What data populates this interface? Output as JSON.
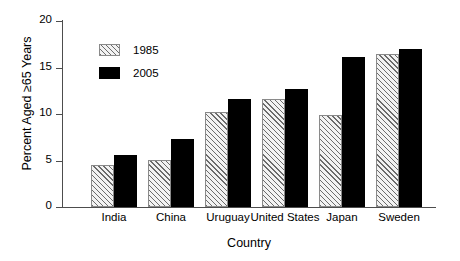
{
  "chart_data": {
    "type": "bar",
    "title": "",
    "xlabel": "Country",
    "ylabel": "Percent Aged ≥65 Years",
    "categories": [
      "India",
      "China",
      "Uruguay",
      "United States",
      "Japan",
      "Sweden"
    ],
    "series": [
      {
        "name": "1985",
        "values": [
          4.5,
          5.1,
          10.2,
          11.6,
          9.9,
          16.5
        ],
        "fill": "diagonal-hatch",
        "color": "#f2f2f2"
      },
      {
        "name": "2005",
        "values": [
          5.6,
          7.3,
          11.6,
          12.7,
          16.1,
          17.0
        ],
        "fill": "solid",
        "color": "#000000"
      }
    ],
    "ylim": [
      0,
      20
    ],
    "yticks": [
      0,
      5,
      10,
      15,
      20
    ],
    "yticklabels": [
      "0",
      "5",
      "10",
      "15",
      "20"
    ],
    "grid": false,
    "legend_position": "upper-left-inside"
  },
  "legend": {
    "entries": [
      {
        "label": "1985"
      },
      {
        "label": "2005"
      }
    ]
  }
}
